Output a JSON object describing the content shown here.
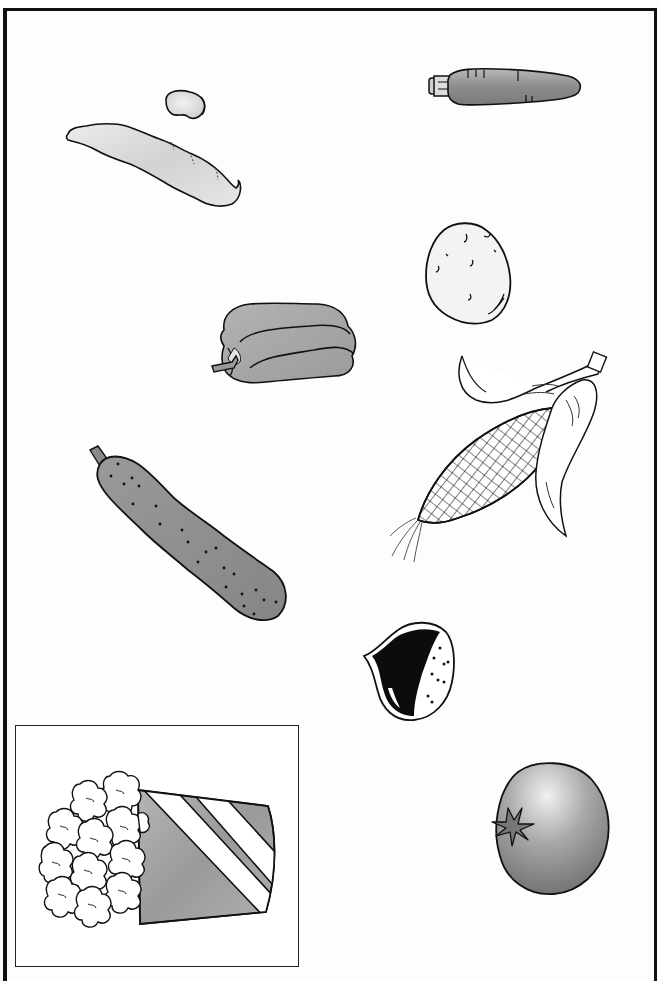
{
  "worksheet": {
    "type": "picture-worksheet",
    "theme": "vegetables",
    "border_color": "#111111",
    "background": "#ffffff"
  },
  "items": [
    {
      "id": "bean-seed",
      "label": "bean seed",
      "fill": "#e6e6e6"
    },
    {
      "id": "bean-pod",
      "label": "bean pod",
      "fill": "#dedede"
    },
    {
      "id": "carrot",
      "label": "carrot",
      "fill": "#9a9a9a"
    },
    {
      "id": "potato",
      "label": "potato",
      "fill": "#f4f4f4"
    },
    {
      "id": "bell-pepper",
      "label": "bell pepper",
      "fill": "#a6a6a6"
    },
    {
      "id": "corn",
      "label": "corn on the cob",
      "fill": "#ffffff"
    },
    {
      "id": "cucumber",
      "label": "cucumber",
      "fill": "#8f8f8f"
    },
    {
      "id": "chestnut",
      "label": "chestnut",
      "fill": "#111111"
    },
    {
      "id": "tomato",
      "label": "tomato",
      "fill": "#8a8a8a"
    }
  ],
  "example": {
    "id": "popcorn",
    "label": "popcorn",
    "boxed": true,
    "fill": "#a3a3a3"
  }
}
